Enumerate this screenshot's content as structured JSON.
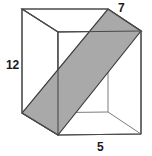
{
  "figure": {
    "type": "geometry-diagram",
    "shape_name": "rectangular-prism",
    "labels": {
      "height": "12",
      "depth": "7",
      "width": "5"
    },
    "colors": {
      "background": "#ffffff",
      "edge_stroke": "#4a4a4a",
      "hidden_edge_stroke": "#8a8a8a",
      "shaded_plane_fill": "#a9a9a9",
      "shaded_plane_stroke": "#3c3c3c",
      "label_text": "#1a1a1a"
    },
    "vertices": {
      "back_top_left": [
        22,
        9
      ],
      "back_top_right": [
        108,
        9
      ],
      "front_top_left": [
        58,
        32
      ],
      "front_top_right": [
        141,
        31
      ],
      "back_bottom_left": [
        22,
        113
      ],
      "back_bottom_right": [
        108,
        112
      ],
      "front_bottom_left": [
        58,
        135
      ],
      "front_bottom_right": [
        141,
        134
      ]
    },
    "shaded_plane_vertices": [
      [
        58,
        135
      ],
      [
        22,
        113
      ],
      [
        108,
        9
      ],
      [
        141,
        31
      ]
    ]
  }
}
